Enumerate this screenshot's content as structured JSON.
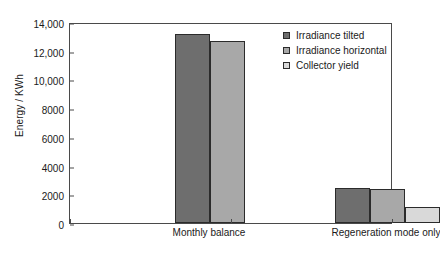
{
  "chart_data": {
    "type": "bar",
    "title": "",
    "xlabel": "",
    "ylabel": "Energy / KWh",
    "ylim": [
      0,
      14000
    ],
    "ytick_step": 2000,
    "ytick_labels": [
      "0",
      "2000",
      "4000",
      "6000",
      "8000",
      "10,000",
      "12,000",
      "14,000"
    ],
    "ytick_values": [
      0,
      2000,
      4000,
      6000,
      8000,
      10000,
      12000,
      14000
    ],
    "grid": false,
    "legend_position": "top-right-inside",
    "categories": [
      "Monthly balance",
      "Regeneration mode only"
    ],
    "series": [
      {
        "name": "Irradiance tilted",
        "color": "#6e6e6e",
        "values": [
          13200,
          2450
        ]
      },
      {
        "name": "Irradiance horizontal",
        "color": "#a8a8a8",
        "values": [
          12700,
          2400
        ]
      },
      {
        "name": "Collector yield",
        "color": "#d9d9d9",
        "values": [
          null,
          1150
        ]
      }
    ]
  },
  "axis": {
    "frame_color": "#4a4a4a",
    "bar_outline_color": "#2b2b2b"
  }
}
